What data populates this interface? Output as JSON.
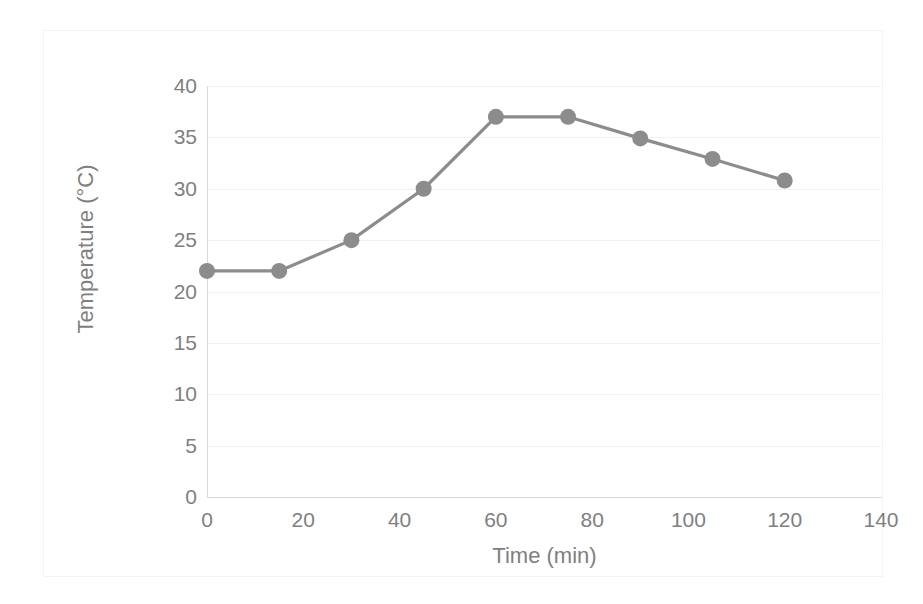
{
  "chart_data": {
    "type": "line",
    "title": "",
    "xlabel": "Time (min)",
    "ylabel": "Temperature (°C)",
    "xlim": [
      0,
      140
    ],
    "ylim": [
      0,
      40
    ],
    "xticks": [
      0,
      20,
      40,
      60,
      80,
      100,
      120,
      140
    ],
    "yticks": [
      0,
      5,
      10,
      15,
      20,
      25,
      30,
      35,
      40
    ],
    "xtick_labels": [
      "0",
      "20",
      "40",
      "60",
      "80",
      "100",
      "120",
      "140"
    ],
    "ytick_labels": [
      "0",
      "5",
      "10",
      "15",
      "20",
      "25",
      "30",
      "35",
      "40"
    ],
    "grid": "horizontal",
    "legend": "none",
    "series": [
      {
        "name": "Temperature",
        "color": "#8c8c8c",
        "marker": "circle",
        "x": [
          0,
          15,
          30,
          45,
          60,
          75,
          90,
          105,
          120
        ],
        "values": [
          22.0,
          22.0,
          25.0,
          30.0,
          37.0,
          37.0,
          34.9,
          32.9,
          30.8
        ]
      }
    ]
  },
  "colors": {
    "series": "#8c8c8c",
    "axis_line": "#d9d9d9",
    "grid_line": "#f2f2f2",
    "tick_text": "#7f7f7f",
    "card_border": "#f4f4f4",
    "background": "#ffffff"
  }
}
